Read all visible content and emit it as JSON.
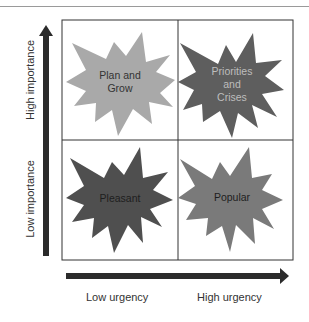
{
  "axes": {
    "y_high": "High importance",
    "y_low": "Low importance",
    "x_low": "Low urgency",
    "x_high": "High urgency"
  },
  "quadrants": [
    {
      "position": "top-left",
      "label_line1": "Plan and",
      "label_line2": "Grow",
      "label_line3": "",
      "color": "#a9a9a9"
    },
    {
      "position": "top-right",
      "label_line1": "Priorities",
      "label_line2": "and",
      "label_line3": "Crises",
      "color": "#5e5e5e"
    },
    {
      "position": "bottom-left",
      "label_line1": "Pleasant",
      "label_line2": "",
      "label_line3": "",
      "color": "#4f4f4f"
    },
    {
      "position": "bottom-right",
      "label_line1": "Popular",
      "label_line2": "",
      "label_line3": "",
      "color": "#7a7a7a"
    }
  ],
  "colors": {
    "arrow": "#2b2b2b",
    "grid": "#333333"
  }
}
